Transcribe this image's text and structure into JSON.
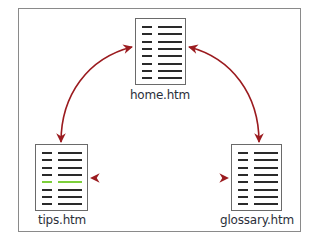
{
  "diagram": {
    "nodes": [
      {
        "id": "home",
        "label": "home.htm",
        "highlight_row": null
      },
      {
        "id": "tips",
        "label": "tips.htm",
        "highlight_row": 4
      },
      {
        "id": "glossary",
        "label": "glossary.htm",
        "highlight_row": null
      }
    ],
    "edges": [
      {
        "from": "tips",
        "to": "home",
        "type": "bidirectional"
      },
      {
        "from": "home",
        "to": "glossary",
        "type": "bidirectional"
      },
      {
        "from": "tips",
        "to": "glossary",
        "type": "bidirectional"
      }
    ],
    "colors": {
      "arrow": "#9b1b1f",
      "gradient_mid": "#c8174a",
      "gradient_end": "#b8e05a",
      "highlight_line": "#7ccf3a",
      "doc_line": "#2a2a2a",
      "frame_border": "#8a8a8a"
    },
    "doc_icon": "document-icon",
    "lines_per_doc": 8
  }
}
